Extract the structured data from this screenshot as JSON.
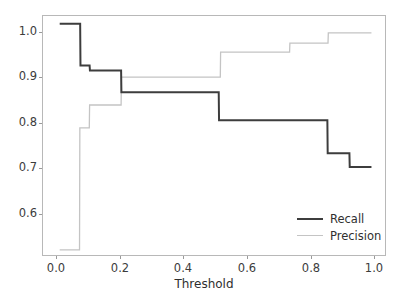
{
  "chart_data": {
    "type": "line",
    "title": "",
    "xlabel": "Threshold",
    "ylabel": "",
    "xlim": [
      -0.043,
      1.043
    ],
    "ylim": [
      0.5448,
      1.0152
    ],
    "grid": false,
    "legend_position": "lower right",
    "xticks": [
      "0.0",
      "0.2",
      "0.4",
      "0.6",
      "0.8",
      "1.0"
    ],
    "xtick_values": [
      0.0,
      0.2,
      0.4,
      0.6,
      0.8,
      1.0
    ],
    "yticks": [
      "0.6",
      "0.7",
      "0.8",
      "0.9",
      "1.0"
    ],
    "ytick_values": [
      0.6,
      0.7,
      0.8,
      0.9,
      1.0
    ],
    "drawstyle": "steps-post",
    "series": [
      {
        "name": "Recall",
        "color": "#3d3d3d",
        "linewidth": 2.0,
        "x": [
          0.01,
          0.075,
          0.076,
          0.105,
          0.106,
          0.205,
          0.206,
          0.515,
          0.516,
          0.86,
          0.861,
          0.93,
          0.931,
          1.0
        ],
        "y": [
          1.0,
          1.0,
          0.918,
          0.918,
          0.908,
          0.908,
          0.865,
          0.865,
          0.81,
          0.81,
          0.745,
          0.745,
          0.718,
          0.718
        ]
      },
      {
        "name": "Precision",
        "color": "#c4c4c4",
        "linewidth": 1.3,
        "x": [
          0.01,
          0.073,
          0.074,
          0.104,
          0.105,
          0.205,
          0.206,
          0.52,
          0.521,
          0.74,
          0.741,
          0.862,
          0.863,
          1.0
        ],
        "y": [
          0.555,
          0.555,
          0.795,
          0.795,
          0.84,
          0.84,
          0.895,
          0.895,
          0.944,
          0.944,
          0.962,
          0.962,
          0.982,
          0.982
        ]
      }
    ],
    "legend_entries": [
      {
        "label": "Recall",
        "color": "#3d3d3d"
      },
      {
        "label": "Precision",
        "color": "#c4c4c4"
      }
    ]
  },
  "axes": {
    "frame_color": "#b8b8b8",
    "tick_color": "#9a9a9a",
    "text_color": "#3c3c3c",
    "background": "#ffffff"
  }
}
